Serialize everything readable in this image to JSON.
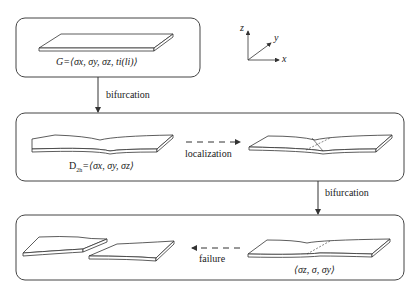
{
  "diagram": {
    "axes": {
      "x": "x",
      "y": "y",
      "z": "z"
    },
    "stages": [
      {
        "id": "stage-1",
        "formula": "G = ⟨σx, σy, σz, ti(li)⟩",
        "state": "uniform plate"
      },
      {
        "id": "stage-2",
        "formula": "D2h = ⟨σx, σy, σz⟩",
        "state": "diffuse necking"
      },
      {
        "id": "stage-3",
        "formula": "⟨σz, σ, σy⟩",
        "state": "localized band"
      }
    ],
    "transitions": {
      "bifurcation_1": "bifurcation",
      "localization": "localization",
      "bifurcation_2": "bifurcation",
      "failure": "failure"
    },
    "labels": {
      "g_prefix": "G=",
      "g_formula": "⟨σx, σy, σz, ti(li)⟩",
      "d_prefix": "D",
      "d_sub": "2h",
      "d_formula": "=⟨σx, σy, σz⟩",
      "c_formula": "⟨σz, σ, σy⟩"
    },
    "colors": {
      "stroke": "#333333",
      "background": "#ffffff"
    }
  }
}
